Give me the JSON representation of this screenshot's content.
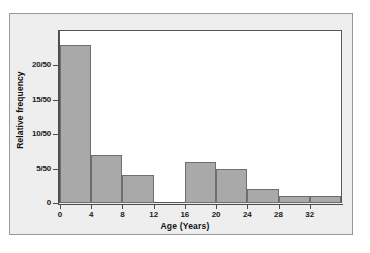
{
  "chart_data": {
    "type": "bar",
    "title": "",
    "xlabel": "Age (Years)",
    "ylabel": "Relative frequency",
    "grid": false,
    "legend": null,
    "xlim": [
      0,
      36
    ],
    "ylim": [
      0,
      25
    ],
    "xticks": [
      "0",
      "4",
      "8",
      "12",
      "16",
      "20",
      "24",
      "28",
      "32"
    ],
    "xtick_values": [
      0,
      4,
      8,
      12,
      16,
      20,
      24,
      28,
      32
    ],
    "yticks": [
      "0",
      "5/50",
      "10/50",
      "15/50",
      "20/50"
    ],
    "ytick_values": [
      0,
      5,
      10,
      15,
      20
    ],
    "bin_width": 4,
    "bins": [
      {
        "label": "0-4",
        "start": 0,
        "end": 4,
        "value": 23
      },
      {
        "label": "4-8",
        "start": 4,
        "end": 8,
        "value": 7
      },
      {
        "label": "8-12",
        "start": 8,
        "end": 12,
        "value": 4
      },
      {
        "label": "12-16",
        "start": 12,
        "end": 16,
        "value": 0
      },
      {
        "label": "16-20",
        "start": 16,
        "end": 20,
        "value": 6
      },
      {
        "label": "20-24",
        "start": 20,
        "end": 24,
        "value": 5
      },
      {
        "label": "24-28",
        "start": 24,
        "end": 28,
        "value": 2
      },
      {
        "label": "28-32",
        "start": 28,
        "end": 32,
        "value": 1
      },
      {
        "label": "32-36",
        "start": 32,
        "end": 36,
        "value": 1
      }
    ],
    "categories": [
      "0-4",
      "4-8",
      "8-12",
      "12-16",
      "16-20",
      "20-24",
      "24-28",
      "28-32",
      "32-36"
    ],
    "values": [
      23,
      7,
      4,
      0,
      6,
      5,
      2,
      1,
      1
    ],
    "denominator": 50,
    "colors": {
      "bar_fill": "#a9a9a9",
      "bar_stroke": "#6e6e6e",
      "axis": "#4a4a4a",
      "plot_background": "#ffffff",
      "panel_background": "#eeeeee",
      "text": "#111111"
    }
  }
}
